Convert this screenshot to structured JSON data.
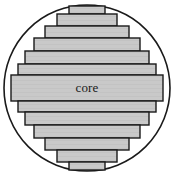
{
  "figure": {
    "name": "circle-horizontal-band-mesh",
    "label": "core",
    "background_color": "#ffffff",
    "band_fill_color": "#c9c9c9",
    "band_stroke_color": "#1a1a1a",
    "circle_stroke_color": "#1a1a1a",
    "label_color": "#1a1a1a",
    "circle": {
      "cx": 87,
      "cy": 88,
      "r": 83
    },
    "bands": [
      {
        "index": 0,
        "y": 6,
        "height": 8,
        "x": 69,
        "width": 36,
        "is_core": false
      },
      {
        "index": 1,
        "y": 14,
        "height": 12,
        "x": 57,
        "width": 60,
        "is_core": false
      },
      {
        "index": 2,
        "y": 26,
        "height": 12,
        "x": 45,
        "width": 84,
        "is_core": false
      },
      {
        "index": 3,
        "y": 38,
        "height": 13,
        "x": 34,
        "width": 106,
        "is_core": false
      },
      {
        "index": 4,
        "y": 51,
        "height": 13,
        "x": 25,
        "width": 124,
        "is_core": false
      },
      {
        "index": 5,
        "y": 64,
        "height": 11,
        "x": 18,
        "width": 138,
        "is_core": false
      },
      {
        "index": 6,
        "y": 75,
        "height": 26,
        "x": 11,
        "width": 152,
        "is_core": true
      },
      {
        "index": 7,
        "y": 101,
        "height": 11,
        "x": 18,
        "width": 138,
        "is_core": false
      },
      {
        "index": 8,
        "y": 112,
        "height": 13,
        "x": 25,
        "width": 124,
        "is_core": false
      },
      {
        "index": 9,
        "y": 125,
        "height": 13,
        "x": 34,
        "width": 106,
        "is_core": false
      },
      {
        "index": 10,
        "y": 138,
        "height": 12,
        "x": 45,
        "width": 84,
        "is_core": false
      },
      {
        "index": 11,
        "y": 150,
        "height": 12,
        "x": 57,
        "width": 60,
        "is_core": false
      },
      {
        "index": 12,
        "y": 162,
        "height": 8,
        "x": 69,
        "width": 36,
        "is_core": false
      }
    ]
  }
}
